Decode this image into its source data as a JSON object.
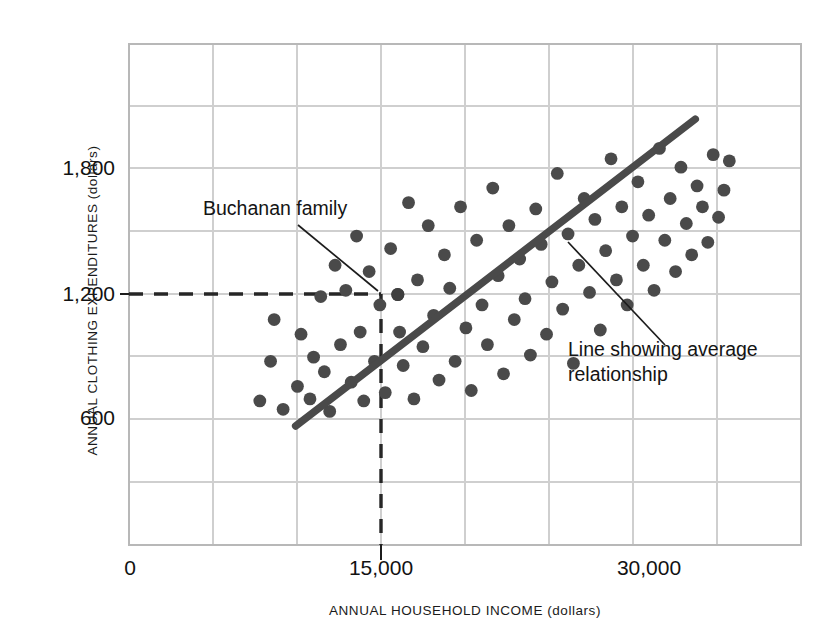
{
  "chart_data": {
    "type": "scatter",
    "title": "",
    "xlabel": "ANNUAL HOUSEHOLD INCOME (dollars)",
    "ylabel": "ANNUAL CLOTHING EXPENDITURES (dollars)",
    "xlim": [
      0,
      37500
    ],
    "ylim": [
      0,
      2400
    ],
    "xticks": [
      0,
      15000,
      30000
    ],
    "xtick_labels": [
      "0",
      "15,000",
      "30,000"
    ],
    "yticks": [
      600,
      1200,
      1800
    ],
    "ytick_labels": [
      "600",
      "1,200",
      "1,800"
    ],
    "grid": true,
    "grid_x_step": 4687.5,
    "grid_y_step": 300,
    "legend": "none",
    "marker_color": "#4a4a4a",
    "line_color": "#4a4a4a",
    "grid_color": "#cccccc",
    "points": [
      [
        7300,
        690
      ],
      [
        7900,
        880
      ],
      [
        8100,
        1080
      ],
      [
        8600,
        650
      ],
      [
        9400,
        760
      ],
      [
        9600,
        1010
      ],
      [
        10100,
        700
      ],
      [
        10300,
        900
      ],
      [
        10700,
        1190
      ],
      [
        10900,
        830
      ],
      [
        11200,
        640
      ],
      [
        11500,
        1340
      ],
      [
        11800,
        960
      ],
      [
        12100,
        1220
      ],
      [
        12400,
        780
      ],
      [
        12700,
        1480
      ],
      [
        12900,
        1020
      ],
      [
        13100,
        690
      ],
      [
        13400,
        1310
      ],
      [
        13700,
        880
      ],
      [
        14000,
        1150
      ],
      [
        14300,
        730
      ],
      [
        14600,
        1420
      ],
      [
        15000,
        1200
      ],
      [
        15100,
        1020
      ],
      [
        15300,
        860
      ],
      [
        15600,
        1640
      ],
      [
        15900,
        700
      ],
      [
        16100,
        1270
      ],
      [
        16400,
        950
      ],
      [
        16700,
        1530
      ],
      [
        17000,
        1100
      ],
      [
        17300,
        790
      ],
      [
        17600,
        1390
      ],
      [
        17900,
        1230
      ],
      [
        18200,
        880
      ],
      [
        18500,
        1620
      ],
      [
        18800,
        1040
      ],
      [
        19100,
        740
      ],
      [
        19400,
        1460
      ],
      [
        19700,
        1150
      ],
      [
        20000,
        960
      ],
      [
        20300,
        1710
      ],
      [
        20600,
        1290
      ],
      [
        20900,
        820
      ],
      [
        21200,
        1530
      ],
      [
        21500,
        1080
      ],
      [
        21800,
        1370
      ],
      [
        22100,
        1180
      ],
      [
        22400,
        910
      ],
      [
        22700,
        1610
      ],
      [
        23000,
        1440
      ],
      [
        23300,
        1010
      ],
      [
        23600,
        1260
      ],
      [
        23900,
        1780
      ],
      [
        24200,
        1130
      ],
      [
        24500,
        1490
      ],
      [
        24800,
        870
      ],
      [
        25100,
        1340
      ],
      [
        25400,
        1660
      ],
      [
        25700,
        1210
      ],
      [
        26000,
        1560
      ],
      [
        26300,
        1030
      ],
      [
        26600,
        1410
      ],
      [
        26900,
        1850
      ],
      [
        27200,
        1270
      ],
      [
        27500,
        1620
      ],
      [
        27800,
        1150
      ],
      [
        28100,
        1480
      ],
      [
        28400,
        1740
      ],
      [
        28700,
        1340
      ],
      [
        29000,
        1580
      ],
      [
        29300,
        1220
      ],
      [
        29600,
        1900
      ],
      [
        29900,
        1460
      ],
      [
        30200,
        1660
      ],
      [
        30500,
        1310
      ],
      [
        30800,
        1810
      ],
      [
        31100,
        1540
      ],
      [
        31400,
        1390
      ],
      [
        31700,
        1720
      ],
      [
        32000,
        1620
      ],
      [
        32300,
        1450
      ],
      [
        32600,
        1870
      ],
      [
        32900,
        1570
      ],
      [
        33200,
        1700
      ],
      [
        33500,
        1840
      ]
    ],
    "trend_line": {
      "x_start": 9300,
      "y_start": 570,
      "x_end": 31600,
      "y_end": 2040
    },
    "highlight": {
      "label": "Buchanan family",
      "x": 15000,
      "y": 1200
    },
    "guides": [
      {
        "name": "buchanan-horizontal-guide",
        "y": 1200,
        "x_from": 0,
        "x_to": 15000,
        "style": "dashed"
      },
      {
        "name": "buchanan-vertical-guide",
        "x": 15000,
        "y_from": 0,
        "y_to": 1200,
        "style": "dashed"
      }
    ],
    "annotations": [
      {
        "name": "buchanan-family-annotation",
        "text": "Buchanan family",
        "target_x": 15000,
        "target_y": 1200
      },
      {
        "name": "average-line-annotation",
        "line1": "Line showing average",
        "line2": "relationship",
        "target_x": 24200,
        "target_y": 1505
      }
    ]
  },
  "axes": {
    "x_title": "ANNUAL HOUSEHOLD INCOME (dollars)",
    "y_title": "ANNUAL CLOTHING EXPENDITURES (dollars)",
    "x_tick_0": "0",
    "x_tick_1": "15,000",
    "x_tick_2": "30,000",
    "y_tick_0": "600",
    "y_tick_1": "1,200",
    "y_tick_2": "1,800"
  },
  "annotations": {
    "buchanan": "Buchanan family",
    "avg_line_1": "Line showing average",
    "avg_line_2": "relationship"
  },
  "cropped_header": {
    "text": ""
  }
}
